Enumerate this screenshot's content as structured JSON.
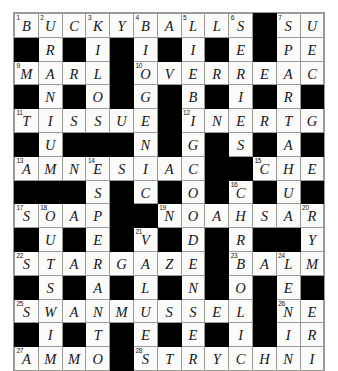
{
  "puzzle": {
    "title": "Crossword grid",
    "rows": 13,
    "cols": 13,
    "cell_size_px": 22.8,
    "colors": {
      "block": "#000000",
      "cell": "#fbfbf9",
      "grid_line": "#9a9a96",
      "letter": "#16161b",
      "number": "#15151a",
      "page_background": "#ffffff"
    },
    "grid": [
      [
        {
          "n": "1",
          "l": "B"
        },
        {
          "n": "2",
          "l": "U"
        },
        {
          "n": "",
          "l": "C"
        },
        {
          "n": "3",
          "l": "K"
        },
        {
          "n": "",
          "l": "Y"
        },
        {
          "n": "4",
          "l": "B"
        },
        {
          "n": "",
          "l": "A"
        },
        {
          "n": "5",
          "l": "L"
        },
        {
          "n": "",
          "l": "L"
        },
        {
          "n": "6",
          "l": "S"
        },
        {
          "n": "",
          "l": null
        },
        {
          "n": "7",
          "l": "S"
        },
        {
          "n": "",
          "l": "U"
        }
      ],
      [
        {
          "n": "",
          "l": null
        },
        {
          "n": "",
          "l": "R"
        },
        {
          "n": "",
          "l": null
        },
        {
          "n": "",
          "l": "I"
        },
        {
          "n": "",
          "l": null
        },
        {
          "n": "",
          "l": "I"
        },
        {
          "n": "",
          "l": null
        },
        {
          "n": "",
          "l": "I"
        },
        {
          "n": "",
          "l": null
        },
        {
          "n": "",
          "l": "E"
        },
        {
          "n": "",
          "l": null
        },
        {
          "n": "",
          "l": "P"
        },
        {
          "n": "",
          "l": "E"
        }
      ],
      [
        {
          "n": "9",
          "l": "M"
        },
        {
          "n": "",
          "l": "A"
        },
        {
          "n": "",
          "l": "R"
        },
        {
          "n": "",
          "l": "L"
        },
        {
          "n": "",
          "l": null
        },
        {
          "n": "10",
          "l": "O"
        },
        {
          "n": "",
          "l": "V"
        },
        {
          "n": "",
          "l": "E"
        },
        {
          "n": "",
          "l": "R"
        },
        {
          "n": "",
          "l": "R"
        },
        {
          "n": "",
          "l": "E"
        },
        {
          "n": "",
          "l": "A"
        },
        {
          "n": "",
          "l": "C"
        }
      ],
      [
        {
          "n": "",
          "l": null
        },
        {
          "n": "",
          "l": "N"
        },
        {
          "n": "",
          "l": null
        },
        {
          "n": "",
          "l": "O"
        },
        {
          "n": "",
          "l": null
        },
        {
          "n": "",
          "l": "G"
        },
        {
          "n": "",
          "l": null
        },
        {
          "n": "",
          "l": "B"
        },
        {
          "n": "",
          "l": null
        },
        {
          "n": "",
          "l": "I"
        },
        {
          "n": "",
          "l": null
        },
        {
          "n": "",
          "l": "R"
        },
        {
          "n": "",
          "l": null
        }
      ],
      [
        {
          "n": "11",
          "l": "T"
        },
        {
          "n": "",
          "l": "I"
        },
        {
          "n": "",
          "l": "S"
        },
        {
          "n": "",
          "l": "S"
        },
        {
          "n": "",
          "l": "U"
        },
        {
          "n": "",
          "l": "E"
        },
        {
          "n": "",
          "l": null
        },
        {
          "n": "12",
          "l": "I"
        },
        {
          "n": "",
          "l": "N"
        },
        {
          "n": "",
          "l": "E"
        },
        {
          "n": "",
          "l": "R"
        },
        {
          "n": "",
          "l": "T"
        },
        {
          "n": "",
          "l": "G"
        }
      ],
      [
        {
          "n": "",
          "l": null
        },
        {
          "n": "",
          "l": "U"
        },
        {
          "n": "",
          "l": null
        },
        {
          "n": "",
          "l": null
        },
        {
          "n": "",
          "l": null
        },
        {
          "n": "",
          "l": "N"
        },
        {
          "n": "",
          "l": null
        },
        {
          "n": "",
          "l": "G"
        },
        {
          "n": "",
          "l": null
        },
        {
          "n": "",
          "l": "S"
        },
        {
          "n": "",
          "l": null
        },
        {
          "n": "",
          "l": "A"
        },
        {
          "n": "",
          "l": null
        }
      ],
      [
        {
          "n": "13",
          "l": "A"
        },
        {
          "n": "",
          "l": "M"
        },
        {
          "n": "",
          "l": "N"
        },
        {
          "n": "14",
          "l": "E"
        },
        {
          "n": "",
          "l": "S"
        },
        {
          "n": "",
          "l": "I"
        },
        {
          "n": "",
          "l": "A"
        },
        {
          "n": "",
          "l": "C"
        },
        {
          "n": "",
          "l": null
        },
        {
          "n": "",
          "l": null
        },
        {
          "n": "15",
          "l": "C"
        },
        {
          "n": "",
          "l": "H"
        },
        {
          "n": "",
          "l": "E"
        }
      ],
      [
        {
          "n": "",
          "l": null
        },
        {
          "n": "",
          "l": null
        },
        {
          "n": "",
          "l": null
        },
        {
          "n": "",
          "l": "S"
        },
        {
          "n": "",
          "l": null
        },
        {
          "n": "",
          "l": "C"
        },
        {
          "n": "",
          "l": null
        },
        {
          "n": "",
          "l": "O"
        },
        {
          "n": "",
          "l": null
        },
        {
          "n": "16",
          "l": "C"
        },
        {
          "n": "",
          "l": null
        },
        {
          "n": "",
          "l": "U"
        },
        {
          "n": "",
          "l": null
        }
      ],
      [
        {
          "n": "17",
          "l": "S"
        },
        {
          "n": "18",
          "l": "O"
        },
        {
          "n": "",
          "l": "A"
        },
        {
          "n": "",
          "l": "P"
        },
        {
          "n": "",
          "l": null
        },
        {
          "n": "",
          "l": null
        },
        {
          "n": "19",
          "l": "N"
        },
        {
          "n": "",
          "l": "O"
        },
        {
          "n": "",
          "l": "A"
        },
        {
          "n": "",
          "l": "H"
        },
        {
          "n": "",
          "l": "S"
        },
        {
          "n": "",
          "l": "A"
        },
        {
          "n": "20",
          "l": "R"
        }
      ],
      [
        {
          "n": "",
          "l": null
        },
        {
          "n": "",
          "l": "U"
        },
        {
          "n": "",
          "l": null
        },
        {
          "n": "",
          "l": "E"
        },
        {
          "n": "",
          "l": null
        },
        {
          "n": "21",
          "l": "V"
        },
        {
          "n": "",
          "l": null
        },
        {
          "n": "",
          "l": "D"
        },
        {
          "n": "",
          "l": null
        },
        {
          "n": "",
          "l": "R"
        },
        {
          "n": "",
          "l": null
        },
        {
          "n": "",
          "l": null
        },
        {
          "n": "",
          "l": "Y"
        }
      ],
      [
        {
          "n": "22",
          "l": "S"
        },
        {
          "n": "",
          "l": "T"
        },
        {
          "n": "",
          "l": "A"
        },
        {
          "n": "",
          "l": "R"
        },
        {
          "n": "",
          "l": "G"
        },
        {
          "n": "",
          "l": "A"
        },
        {
          "n": "",
          "l": "Z"
        },
        {
          "n": "",
          "l": "E"
        },
        {
          "n": "",
          "l": null
        },
        {
          "n": "23",
          "l": "B"
        },
        {
          "n": "",
          "l": "A"
        },
        {
          "n": "24",
          "l": "L"
        },
        {
          "n": "",
          "l": "M"
        }
      ],
      [
        {
          "n": "",
          "l": null
        },
        {
          "n": "",
          "l": "S"
        },
        {
          "n": "",
          "l": null
        },
        {
          "n": "",
          "l": "A"
        },
        {
          "n": "",
          "l": null
        },
        {
          "n": "",
          "l": "L"
        },
        {
          "n": "",
          "l": null
        },
        {
          "n": "",
          "l": "N"
        },
        {
          "n": "",
          "l": null
        },
        {
          "n": "",
          "l": "O"
        },
        {
          "n": "",
          "l": null
        },
        {
          "n": "",
          "l": "E"
        },
        {
          "n": "",
          "l": null
        }
      ],
      [
        {
          "n": "25",
          "l": "S"
        },
        {
          "n": "",
          "l": "W"
        },
        {
          "n": "",
          "l": "A"
        },
        {
          "n": "",
          "l": "N"
        },
        {
          "n": "",
          "l": "M"
        },
        {
          "n": "",
          "l": "U"
        },
        {
          "n": "",
          "l": "S"
        },
        {
          "n": "",
          "l": "S"
        },
        {
          "n": "",
          "l": "E"
        },
        {
          "n": "",
          "l": "L"
        },
        {
          "n": "",
          "l": null
        },
        {
          "n": "26",
          "l": "N"
        },
        {
          "n": "",
          "l": "E"
        }
      ],
      [
        {
          "n": "",
          "l": null
        },
        {
          "n": "",
          "l": "I"
        },
        {
          "n": "",
          "l": null
        },
        {
          "n": "",
          "l": "T"
        },
        {
          "n": "",
          "l": null
        },
        {
          "n": "",
          "l": "E"
        },
        {
          "n": "",
          "l": null
        },
        {
          "n": "",
          "l": "E"
        },
        {
          "n": "",
          "l": null
        },
        {
          "n": "",
          "l": "I"
        },
        {
          "n": "",
          "l": null
        },
        {
          "n": "",
          "l": "I"
        },
        {
          "n": "",
          "l": "R"
        }
      ],
      [
        {
          "n": "27",
          "l": "A"
        },
        {
          "n": "",
          "l": "M"
        },
        {
          "n": "",
          "l": "M"
        },
        {
          "n": "",
          "l": "O"
        },
        {
          "n": "",
          "l": null
        },
        {
          "n": "28",
          "l": "S"
        },
        {
          "n": "",
          "l": "T"
        },
        {
          "n": "",
          "l": "R"
        },
        {
          "n": "",
          "l": "Y"
        },
        {
          "n": "",
          "l": "C"
        },
        {
          "n": "",
          "l": "H"
        },
        {
          "n": "",
          "l": "N"
        },
        {
          "n": "",
          "l": "I"
        }
      ]
    ],
    "across_answers": [
      "BUCKYBALLS",
      "SUMO",
      "MARL",
      "OVERREACTS",
      "TISSUE",
      "INERTGAS",
      "AMNESIAC",
      "CHEF",
      "SOAP",
      "NOAHSARK",
      "STARGAZE",
      "BALMER",
      "SWANMUSSEL",
      "NEON",
      "AMMO",
      "STRYCHNINE"
    ],
    "down_answers": [
      "BRAIN",
      "CIRCLE",
      "VOGUE",
      "BIRD",
      "SERPENT",
      "PEACH",
      "MARL",
      "OVERT",
      "SOUSA",
      "VIVID",
      "CHEF",
      "NEON"
    ]
  }
}
